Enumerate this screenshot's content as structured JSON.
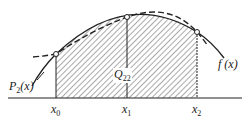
{
  "figure": {
    "colors": {
      "line": "#222222",
      "hatch": "#555555",
      "background": "#ffffff"
    },
    "labels": {
      "p2": {
        "main": "P",
        "sub": "2",
        "tail": "(x)"
      },
      "fx": "f (x)",
      "q": {
        "main": "Q",
        "sub": "22"
      },
      "x0": {
        "main": "x",
        "sub": "0"
      },
      "x1": {
        "main": "x",
        "sub": "1"
      },
      "x2": {
        "main": "x",
        "sub": "2"
      }
    },
    "nodes": [
      {
        "name": "x0",
        "x": 56,
        "y": 54
      },
      {
        "name": "x1",
        "x": 127,
        "y": 17
      },
      {
        "name": "x2",
        "x": 197,
        "y": 32
      }
    ],
    "axis_y": 98
  }
}
